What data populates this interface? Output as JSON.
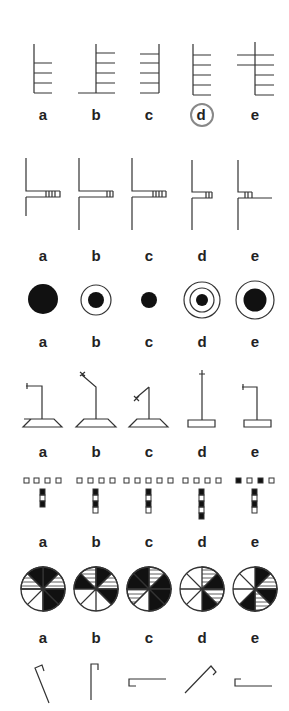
{
  "puzzles": [
    {
      "id": "ladder-shapes",
      "options": [
        "a",
        "b",
        "c",
        "d",
        "e"
      ],
      "selected": "d"
    },
    {
      "id": "t-junction-shapes",
      "options": [
        "a",
        "b",
        "c",
        "d",
        "e"
      ]
    },
    {
      "id": "concentric-circles",
      "options": [
        "a",
        "b",
        "c",
        "d",
        "e"
      ]
    },
    {
      "id": "stand-shapes",
      "options": [
        "a",
        "b",
        "c",
        "d",
        "e"
      ]
    },
    {
      "id": "square-grid-shapes",
      "options": [
        "a",
        "b",
        "c",
        "d",
        "e"
      ]
    },
    {
      "id": "segmented-circles",
      "options": [
        "a",
        "b",
        "c",
        "d",
        "e"
      ]
    },
    {
      "id": "hook-shapes",
      "options": []
    }
  ],
  "colors": {
    "stroke": "#333333",
    "fill": "#111111",
    "selection_ring": "#888888"
  }
}
